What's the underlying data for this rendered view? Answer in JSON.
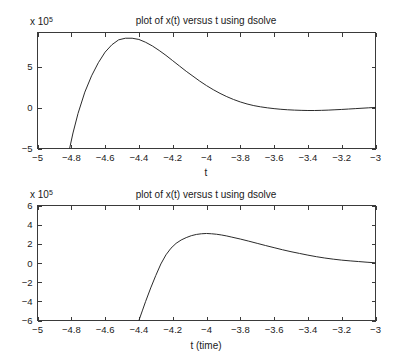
{
  "page": {
    "background_color": "#ffffff",
    "line_color": "#2b2b2b",
    "axis_color": "#3a3a3a",
    "width": 401,
    "height": 362
  },
  "charts": [
    {
      "id": "top",
      "title": "plot of x(t) versus t using dsolve",
      "xlabel": "t",
      "ylabel": "",
      "y_exponent_prefix": "x 10",
      "y_exponent_power": "5",
      "x_ticks": [
        "-5",
        "-4.8",
        "-4.6",
        "-4.4",
        "-4.2",
        "-4",
        "-3.8",
        "-3.6",
        "-3.4",
        "-3.2",
        "-3"
      ],
      "y_ticks": [
        "-5",
        "0",
        "5"
      ]
    },
    {
      "id": "bottom",
      "title": "plot of x(t) versus t using dsolve",
      "xlabel": "t (time)",
      "ylabel": "",
      "y_exponent_prefix": "x 10",
      "y_exponent_power": "5",
      "x_ticks": [
        "-5",
        "-4.8",
        "-4.6",
        "-4.4",
        "-4.2",
        "-4",
        "-3.8",
        "-3.6",
        "-3.4",
        "-3.2",
        "-3"
      ],
      "y_ticks": [
        "-6",
        "-4",
        "-2",
        "0",
        "2",
        "4",
        "6"
      ]
    }
  ],
  "chart_data": [
    {
      "type": "line",
      "title": "plot of x(t) versus t using dsolve",
      "xlabel": "t",
      "ylabel": "",
      "y_scale_factor": 100000,
      "y_scale_label": "x 10^5",
      "xlim": [
        -5,
        -3
      ],
      "ylim": [
        -5,
        9.2
      ],
      "xticks": [
        -5,
        -4.8,
        -4.6,
        -4.4,
        -4.2,
        -4,
        -3.8,
        -3.6,
        -3.4,
        -3.2,
        -3
      ],
      "yticks": [
        -5,
        0,
        5
      ],
      "grid": false,
      "legend": null,
      "series": [
        {
          "name": "x(t)",
          "x": [
            -4.81,
            -4.79,
            -4.76,
            -4.72,
            -4.68,
            -4.64,
            -4.6,
            -4.56,
            -4.52,
            -4.48,
            -4.44,
            -4.4,
            -4.36,
            -4.32,
            -4.28,
            -4.24,
            -4.2,
            -4.16,
            -4.12,
            -4.08,
            -4.04,
            -4.0,
            -3.96,
            -3.92,
            -3.88,
            -3.84,
            -3.8,
            -3.76,
            -3.72,
            -3.68,
            -3.64,
            -3.6,
            -3.56,
            -3.52,
            -3.48,
            -3.44,
            -3.4,
            -3.36,
            -3.32,
            -3.28,
            -3.24,
            -3.2,
            -3.16,
            -3.12,
            -3.08,
            -3.04,
            -3.0
          ],
          "y": [
            -5.0,
            -3.1,
            -0.7,
            1.9,
            3.9,
            5.5,
            6.8,
            7.7,
            8.3,
            8.5,
            8.5,
            8.35,
            8.0,
            7.55,
            7.0,
            6.4,
            5.75,
            5.1,
            4.45,
            3.85,
            3.25,
            2.7,
            2.2,
            1.75,
            1.35,
            1.0,
            0.7,
            0.45,
            0.25,
            0.1,
            -0.02,
            -0.12,
            -0.2,
            -0.26,
            -0.3,
            -0.33,
            -0.35,
            -0.35,
            -0.33,
            -0.3,
            -0.26,
            -0.22,
            -0.17,
            -0.12,
            -0.07,
            -0.02,
            0.03
          ]
        }
      ]
    },
    {
      "type": "line",
      "title": "plot of x(t) versus t using dsolve",
      "xlabel": "t (time)",
      "ylabel": "",
      "y_scale_factor": 100000,
      "y_scale_label": "x 10^5",
      "xlim": [
        -5,
        -3
      ],
      "ylim": [
        -6,
        6
      ],
      "xticks": [
        -5,
        -4.8,
        -4.6,
        -4.4,
        -4.2,
        -4,
        -3.8,
        -3.6,
        -3.4,
        -3.2,
        -3
      ],
      "yticks": [
        -6,
        -4,
        -2,
        0,
        2,
        4,
        6
      ],
      "grid": false,
      "legend": null,
      "series": [
        {
          "name": "x(t)",
          "x": [
            -4.4,
            -4.38,
            -4.36,
            -4.33,
            -4.3,
            -4.27,
            -4.24,
            -4.21,
            -4.18,
            -4.15,
            -4.12,
            -4.09,
            -4.06,
            -4.03,
            -4.0,
            -3.97,
            -3.94,
            -3.91,
            -3.88,
            -3.85,
            -3.8,
            -3.75,
            -3.7,
            -3.65,
            -3.6,
            -3.55,
            -3.5,
            -3.45,
            -3.4,
            -3.35,
            -3.3,
            -3.25,
            -3.2,
            -3.15,
            -3.1,
            -3.05,
            -3.0
          ],
          "y": [
            -6.0,
            -5.0,
            -4.0,
            -2.6,
            -1.3,
            -0.1,
            0.85,
            1.55,
            2.05,
            2.4,
            2.65,
            2.85,
            2.98,
            3.05,
            3.08,
            3.05,
            3.0,
            2.92,
            2.82,
            2.7,
            2.5,
            2.28,
            2.05,
            1.82,
            1.6,
            1.38,
            1.18,
            1.0,
            0.82,
            0.66,
            0.52,
            0.4,
            0.3,
            0.22,
            0.15,
            0.08,
            0.02
          ]
        }
      ]
    }
  ]
}
